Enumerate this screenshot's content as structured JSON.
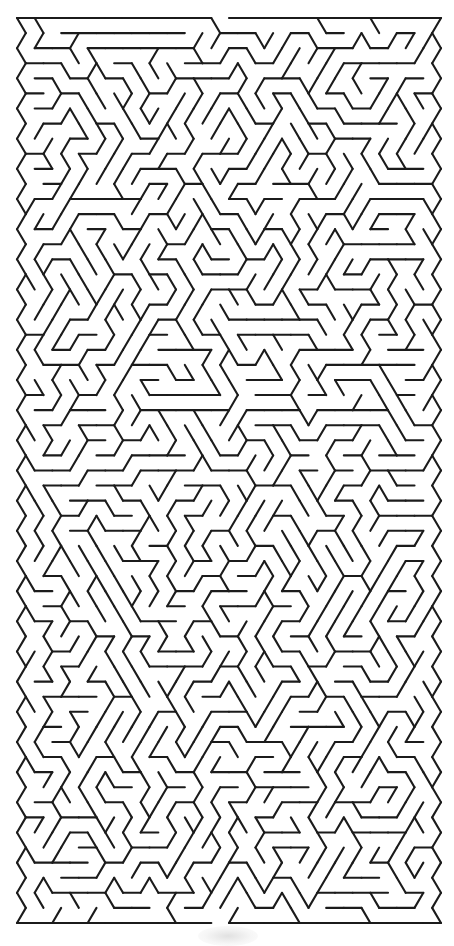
{
  "title": "Triangular lattice maze",
  "canvas": {
    "width": 454,
    "height": 938,
    "background": "#ffffff"
  },
  "style": {
    "wall_color": "#1b1b1b",
    "wall_width": 2.1
  },
  "lattice": {
    "x0": 17,
    "y0": 18,
    "unit": 17.667,
    "row_height": 15.083,
    "rows": 60,
    "even_row_points": 25,
    "odd_row_offset": -0.5
  },
  "entrance": {
    "edge": "top",
    "segment_index": 11,
    "label": "Start"
  },
  "exit": {
    "edge": "bottom",
    "segment_index": 11,
    "label": "Finish"
  },
  "generator": {
    "algorithm": "randomized-dfs-spanning-tree",
    "seed": 20240517
  },
  "watermark": {
    "visible": true,
    "color": "#d6d6d6"
  }
}
